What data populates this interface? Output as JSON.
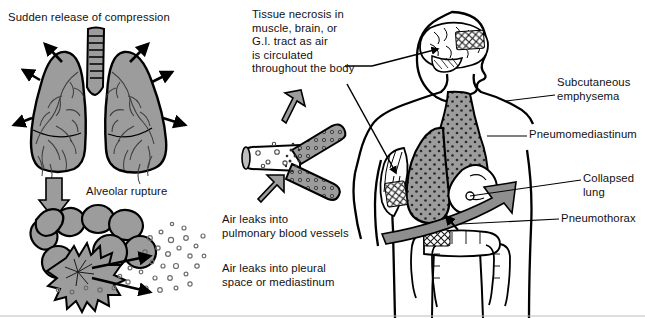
{
  "diagram": {
    "colors": {
      "outline": "#000000",
      "organ_fill": "#9c9c9c",
      "arrow_gray": "#8e8e8e",
      "background": "#ffffff",
      "text": "#111111"
    }
  },
  "captions": {
    "sudden_release": "Sudden release of compression",
    "alveolar_rupture": "Alveolar rupture",
    "tissue_necrosis": "Tissue necrosis in\nmuscle, brain, or\nG.I. tract as air\nis circulated\nthroughout the body",
    "pulmonary_vessels": "Air leaks into\npulmonary blood vessels",
    "pleural_space": "Air leaks into pleural\nspace or mediastinum",
    "subcutaneous_emphysema": "Subcutaneous\nemphysema",
    "pneumomediastinum": "Pneumomediastinum",
    "collapsed_lung": "Collapsed\nlung",
    "pneumothorax": "Pneumothorax"
  },
  "panels": {
    "lungs": {
      "name": "lungs-with-trachea",
      "arrow_count": 6,
      "arrow_direction": "radiating outward"
    },
    "alveoli": {
      "name": "alveolar-cluster-rupture",
      "bubble_count": 60
    },
    "vessel": {
      "name": "branching-blood-vessel-with-air-bubbles",
      "arrow_count": 2
    },
    "body": {
      "name": "human-figure-coronal",
      "parts": [
        "brain-air-embolism",
        "neck-subcutaneous-emphysema",
        "arm-muscle-necrosis",
        "collapsed-lung",
        "heart",
        "mediastinum",
        "large-intestine-gi-tract"
      ]
    }
  }
}
